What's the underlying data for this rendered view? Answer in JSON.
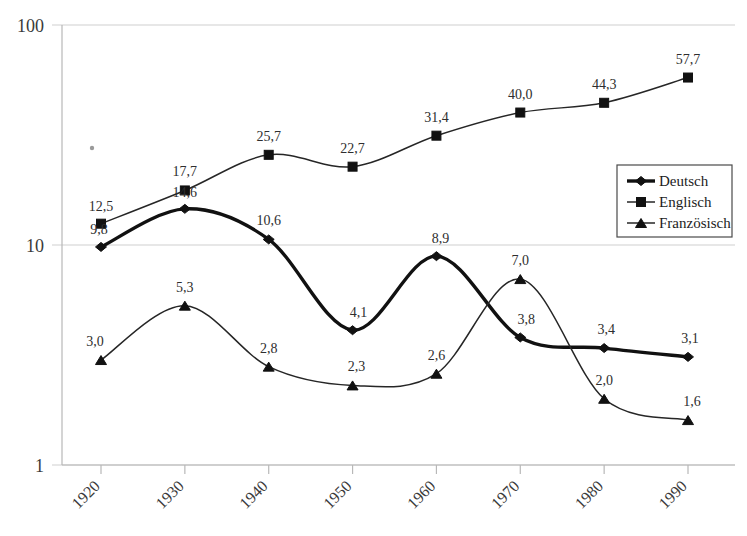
{
  "chart_data": {
    "type": "line",
    "title": "",
    "subtitle": "",
    "xlabel": "",
    "ylabel": "",
    "yscale": "log",
    "ylim": [
      1,
      100
    ],
    "y_ticks": [
      "1",
      "10",
      "100"
    ],
    "y_tick_values": [
      1,
      10,
      100
    ],
    "grid": true,
    "legend_position": "right",
    "categories": [
      "1920",
      "1930",
      "1940",
      "1950",
      "1960",
      "1970",
      "1980",
      "1990"
    ],
    "x": [
      1920,
      1930,
      1940,
      1950,
      1960,
      1970,
      1980,
      1990
    ],
    "series": [
      {
        "name": "Deutsch",
        "marker": "diamond",
        "line_weight": "thick",
        "values": [
          9.8,
          14.6,
          10.6,
          4.1,
          8.9,
          3.8,
          3.4,
          3.1
        ],
        "labels": [
          "9,8",
          "14,6",
          "10,6",
          "4,1",
          "8,9",
          "3,8",
          "3,4",
          "3,1"
        ]
      },
      {
        "name": "Englisch",
        "marker": "square",
        "line_weight": "thin",
        "values": [
          12.5,
          17.7,
          25.7,
          22.7,
          31.4,
          40.0,
          44.3,
          57.7
        ],
        "labels": [
          "12,5",
          "17,7",
          "25,7",
          "22,7",
          "31,4",
          "40,0",
          "44,3",
          "57,7"
        ]
      },
      {
        "name": "Französisch",
        "marker": "triangle",
        "line_weight": "thin",
        "values": [
          3.0,
          5.3,
          2.8,
          2.3,
          2.6,
          7.0,
          2.0,
          1.6
        ],
        "labels": [
          "3,0",
          "5,3",
          "2,8",
          "2,3",
          "2,6",
          "7,0",
          "2,0",
          "1,6"
        ]
      }
    ]
  },
  "legend": {
    "items": [
      {
        "label": "Deutsch",
        "marker": "diamond-marker-icon"
      },
      {
        "label": "Englisch",
        "marker": "square-marker-icon"
      },
      {
        "label": "Französisch",
        "marker": "triangle-marker-icon"
      }
    ]
  },
  "colors": {
    "series_stroke": "#111111",
    "grid": "#cfcfcf",
    "axis": "#b8b8b8",
    "label_text": "#2e2e2e",
    "legend_border": "#4a4a4a",
    "background": "#ffffff"
  }
}
